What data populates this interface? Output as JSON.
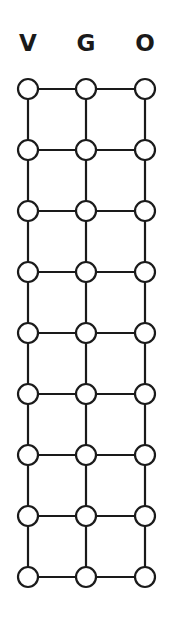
{
  "columns": [
    {
      "label": "V",
      "x": 28
    },
    {
      "label": "G",
      "x": 86
    },
    {
      "label": "O",
      "x": 145
    }
  ],
  "rows": [
    89,
    150,
    211,
    272,
    333,
    394,
    455,
    516,
    577
  ],
  "node_radius": 10,
  "stroke_color": "#1a1a1a",
  "node_fill": "#ffffff"
}
